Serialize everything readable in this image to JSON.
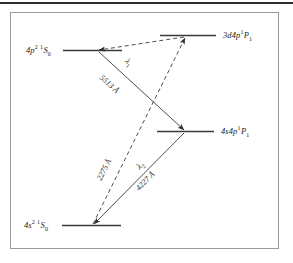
{
  "figure": {
    "type": "energy-level-diagram",
    "title_visible": false,
    "border_color": "#9a9a9a",
    "line_color": "#3a3a3a",
    "background": "#ffffff"
  },
  "levels": [
    {
      "id": "3d4p",
      "label_config": "3d4p",
      "label_term_sup": "1",
      "label_term": "P",
      "label_term_sub": "1",
      "label_full": "3d4p ¹P₁",
      "position": "top-right"
    },
    {
      "id": "4p2",
      "label_config": "4p",
      "label_config_sup": "2",
      "label_term_sup": "1",
      "label_term": "S",
      "label_term_sub": "0",
      "label_full": "4p² ¹S₀",
      "position": "upper-left"
    },
    {
      "id": "4s4p",
      "label_config": "4s4p",
      "label_term_sup": "1",
      "label_term": "P",
      "label_term_sub": "1",
      "label_full": "4s4p ¹P₁",
      "position": "middle-right"
    },
    {
      "id": "4s2",
      "label_config": "4s",
      "label_config_sup": "2",
      "label_term_sup": "1",
      "label_term": "S",
      "label_term_sub": "0",
      "label_full": "4s² ¹S₀",
      "position": "bottom-left"
    }
  ],
  "transitions": [
    {
      "id": "lambda1",
      "symbol": "λ",
      "symbol_sub": "1",
      "wavelength": "5513 Å",
      "style": "solid",
      "from": "4p2",
      "to": "4s4p"
    },
    {
      "id": "pump-2275",
      "wavelength": "2275 Å",
      "style": "dashed",
      "from": "4s2",
      "to": "3d4p"
    },
    {
      "id": "lambda2",
      "symbol": "λ",
      "symbol_sub": "2",
      "wavelength": "4227 Å",
      "style": "solid",
      "from": "4s4p",
      "to": "4s2"
    },
    {
      "id": "cascade-3d4p-4p2",
      "wavelength": "",
      "style": "dashed",
      "from": "3d4p",
      "to": "4p2"
    }
  ]
}
